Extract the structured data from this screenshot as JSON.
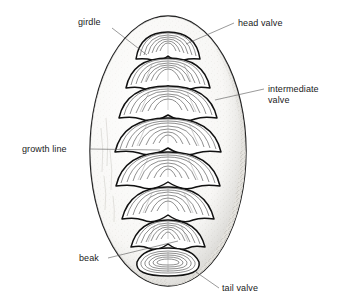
{
  "figure": {
    "background_color": "#ffffff",
    "ink_color": "#111111",
    "leader_color": "#555555",
    "girdle_fill": "#f2f1ee",
    "girdle_shade": "#cfcdc7",
    "valve_fill": "#ffffff"
  },
  "labels": [
    {
      "id": "girdle",
      "text": "girdle",
      "x": 78,
      "y": 25,
      "anchor": "start",
      "leader": "M 112 28 L 147 55"
    },
    {
      "id": "head-valve",
      "text": "head valve",
      "x": 238,
      "y": 26,
      "anchor": "start",
      "leader": "M 234 23 L 186 44"
    },
    {
      "id": "intermediate-valve",
      "text": "intermediate",
      "text2": "valve",
      "x": 268,
      "y": 92,
      "y2": 103,
      "anchor": "start",
      "leader": "M 264 89 L 215 100"
    },
    {
      "id": "growth-line",
      "text": "growth line",
      "x": 22,
      "y": 152,
      "anchor": "start",
      "leader": "M 90 149 L 160 150"
    },
    {
      "id": "beak",
      "text": "beak",
      "x": 79,
      "y": 261,
      "anchor": "start",
      "leader": "M 108 258 L 178 241"
    },
    {
      "id": "tail-valve",
      "text": "tail valve",
      "x": 222,
      "y": 291,
      "anchor": "start",
      "leader": "M 219 288 L 196 272"
    }
  ],
  "valves": {
    "count": 8,
    "types": [
      "head",
      "intermediate",
      "intermediate",
      "intermediate",
      "intermediate",
      "intermediate",
      "intermediate",
      "tail"
    ],
    "growth_rings_per_valve": 7
  },
  "girdle": {
    "shape": "ellipse",
    "center_x": 168,
    "center_y": 151,
    "radius_x": 78,
    "radius_y": 135
  }
}
